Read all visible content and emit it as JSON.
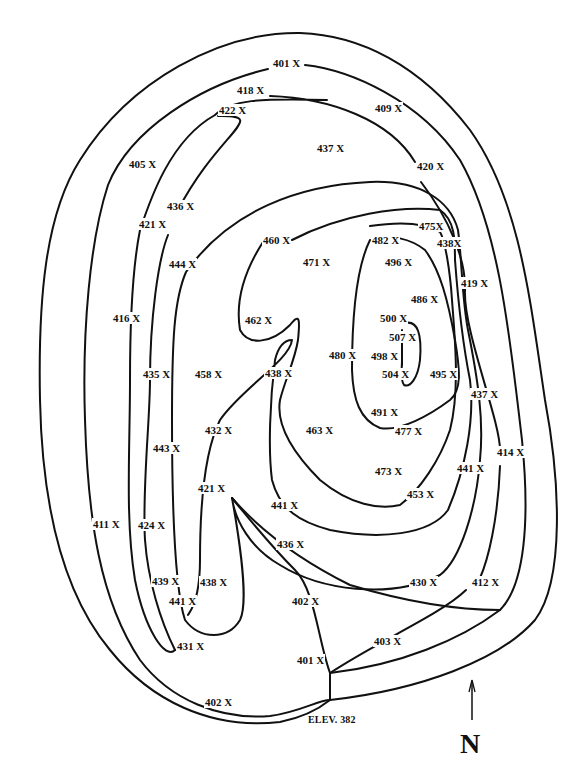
{
  "map": {
    "title": "Topographic contour map",
    "outlet_label": "ELEV. 382",
    "north_label": "N",
    "line_color": "#111111",
    "background": "#ffffff"
  },
  "spot_elevations": [
    {
      "value": "401 X",
      "x": 272,
      "y": 63
    },
    {
      "value": "418 X",
      "x": 236,
      "y": 90
    },
    {
      "value": "422 X",
      "x": 218,
      "y": 110
    },
    {
      "value": "409 X",
      "x": 374,
      "y": 108
    },
    {
      "value": "437 X",
      "x": 316,
      "y": 148
    },
    {
      "value": "405 X",
      "x": 128,
      "y": 164
    },
    {
      "value": "420 X",
      "x": 416,
      "y": 166
    },
    {
      "value": "436 X",
      "x": 166,
      "y": 206
    },
    {
      "value": "421 X",
      "x": 138,
      "y": 224
    },
    {
      "value": "475X",
      "x": 418,
      "y": 226
    },
    {
      "value": "438X",
      "x": 436,
      "y": 243
    },
    {
      "value": "460 X",
      "x": 262,
      "y": 240
    },
    {
      "value": "482 X",
      "x": 371,
      "y": 240
    },
    {
      "value": "471 X",
      "x": 302,
      "y": 262
    },
    {
      "value": "496 X",
      "x": 384,
      "y": 262
    },
    {
      "value": "444 X",
      "x": 168,
      "y": 264
    },
    {
      "value": "419 X",
      "x": 460,
      "y": 283
    },
    {
      "value": "486 X",
      "x": 410,
      "y": 299
    },
    {
      "value": "416 X",
      "x": 112,
      "y": 318
    },
    {
      "value": "462 X",
      "x": 244,
      "y": 320
    },
    {
      "value": "500 X",
      "x": 379,
      "y": 318
    },
    {
      "value": "507 X",
      "x": 388,
      "y": 337
    },
    {
      "value": "480 X",
      "x": 328,
      "y": 355
    },
    {
      "value": "498 X",
      "x": 370,
      "y": 356
    },
    {
      "value": "435 X",
      "x": 142,
      "y": 374
    },
    {
      "value": "458 X",
      "x": 194,
      "y": 374
    },
    {
      "value": "438 X",
      "x": 264,
      "y": 373
    },
    {
      "value": "504 X",
      "x": 381,
      "y": 374
    },
    {
      "value": "495 X",
      "x": 429,
      "y": 374
    },
    {
      "value": "437 X",
      "x": 470,
      "y": 394
    },
    {
      "value": "491 X",
      "x": 370,
      "y": 412
    },
    {
      "value": "432 X",
      "x": 204,
      "y": 430
    },
    {
      "value": "463 X",
      "x": 305,
      "y": 430
    },
    {
      "value": "477 X",
      "x": 394,
      "y": 431
    },
    {
      "value": "443 X",
      "x": 152,
      "y": 448
    },
    {
      "value": "414 X",
      "x": 496,
      "y": 452
    },
    {
      "value": "441 X",
      "x": 456,
      "y": 468
    },
    {
      "value": "473 X",
      "x": 374,
      "y": 471
    },
    {
      "value": "421 X",
      "x": 197,
      "y": 488
    },
    {
      "value": "441 X",
      "x": 270,
      "y": 505
    },
    {
      "value": "453 X",
      "x": 406,
      "y": 494
    },
    {
      "value": "411 X",
      "x": 92,
      "y": 524
    },
    {
      "value": "424 X",
      "x": 137,
      "y": 525
    },
    {
      "value": "436 X",
      "x": 276,
      "y": 544
    },
    {
      "value": "439 X",
      "x": 151,
      "y": 581
    },
    {
      "value": "438 X",
      "x": 199,
      "y": 582
    },
    {
      "value": "430 X",
      "x": 409,
      "y": 582
    },
    {
      "value": "412 X",
      "x": 471,
      "y": 582
    },
    {
      "value": "441 X",
      "x": 168,
      "y": 601
    },
    {
      "value": "402 X",
      "x": 291,
      "y": 601
    },
    {
      "value": "431 X",
      "x": 176,
      "y": 646
    },
    {
      "value": "403 X",
      "x": 373,
      "y": 641
    },
    {
      "value": "401 X",
      "x": 296,
      "y": 660
    },
    {
      "value": "402 X",
      "x": 204,
      "y": 702
    }
  ]
}
